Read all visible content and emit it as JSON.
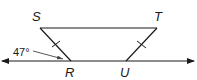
{
  "diagram": {
    "type": "geometry",
    "points": {
      "S": {
        "label": "S",
        "x": 40,
        "y": 28
      },
      "T": {
        "label": "T",
        "x": 157,
        "y": 28
      },
      "R": {
        "label": "R",
        "x": 71,
        "y": 61
      },
      "U": {
        "label": "U",
        "x": 126,
        "y": 61
      }
    },
    "segments": [
      {
        "from": "S",
        "to": "T"
      },
      {
        "from": "S",
        "to": "R",
        "tick_marks": 1
      },
      {
        "from": "T",
        "to": "U",
        "tick_marks": 1
      }
    ],
    "line": {
      "through": [
        "R",
        "U"
      ],
      "arrows": "both"
    },
    "angle_annotation": {
      "value": "47°",
      "at": "R",
      "between": "exterior angle left of R"
    },
    "colors": {
      "stroke": "#1a1a1a",
      "background": "#ffffff"
    }
  }
}
